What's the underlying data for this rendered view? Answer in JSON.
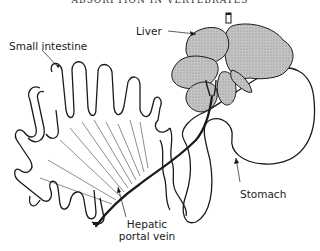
{
  "header": {
    "text": "ABSORPTION IN VERTEBRATES"
  },
  "labels": {
    "small_intestine": "Small intestine",
    "liver": "Liver",
    "stomach": "Stomach",
    "hepatic_portal_vein_line1": "Hepatic",
    "hepatic_portal_vein_line2": "portal vein"
  },
  "colors": {
    "outline": "#1a1a1a",
    "liver_fill": "#b8b8b8",
    "background": "#ffffff"
  }
}
